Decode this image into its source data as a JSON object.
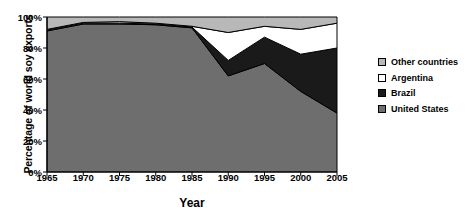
{
  "chart_data": {
    "type": "area",
    "title": "",
    "subtitle": "",
    "xlabel": "Year",
    "ylabel": "Percentage of world soy exports",
    "x": [
      1965,
      1970,
      1975,
      1980,
      1985,
      1990,
      1995,
      2000,
      2005
    ],
    "xticklabels": [
      "1965",
      "1970",
      "1975",
      "1980",
      "1985",
      "1990",
      "1995",
      "2000",
      "2005"
    ],
    "yticklabels": [
      "0%",
      "20%",
      "40%",
      "60%",
      "80%",
      "100%"
    ],
    "yticks": [
      0,
      20,
      40,
      60,
      80,
      100
    ],
    "xlim": [
      1965,
      2005
    ],
    "ylim": [
      0,
      100
    ],
    "grid": false,
    "stacked": true,
    "legend_position": "right",
    "series": [
      {
        "name": "United States",
        "color": "#6e6e6e",
        "values": [
          91,
          95.5,
          95.5,
          95,
          93,
          62,
          70,
          52,
          38
        ]
      },
      {
        "name": "Brazil",
        "color": "#1a1a1a",
        "values": [
          0.5,
          0.5,
          0.5,
          0.5,
          0.5,
          10,
          17,
          24,
          42
        ]
      },
      {
        "name": "Argentina",
        "color": "#ffffff",
        "values": [
          0.5,
          0.5,
          1,
          0.5,
          0.5,
          18,
          7,
          16,
          16
        ]
      },
      {
        "name": "Other countries",
        "color": "#b8b8b8",
        "values": [
          8,
          3.5,
          3,
          4,
          6,
          10,
          6,
          8,
          4
        ]
      }
    ],
    "cumulative_tops": {
      "United States": [
        91,
        95.5,
        95.5,
        95,
        93,
        62,
        70,
        52,
        38
      ],
      "Brazil": [
        91.5,
        96,
        96,
        95.5,
        93.5,
        72,
        87,
        76,
        80
      ],
      "Argentina": [
        92,
        96.5,
        97,
        96,
        94,
        90,
        94,
        92,
        96
      ],
      "Other countries": [
        100,
        100,
        100,
        100,
        100,
        100,
        100,
        100,
        100
      ]
    }
  },
  "legend": {
    "items": [
      {
        "label": "Other countries",
        "swatch": "#b8b8b8"
      },
      {
        "label": "Argentina",
        "swatch": "#ffffff"
      },
      {
        "label": "Brazil",
        "swatch": "#1a1a1a"
      },
      {
        "label": "United States",
        "swatch": "#6e6e6e"
      }
    ]
  },
  "axes": {
    "y_title": "Percentage of world soy exports",
    "x_title": "Year"
  }
}
